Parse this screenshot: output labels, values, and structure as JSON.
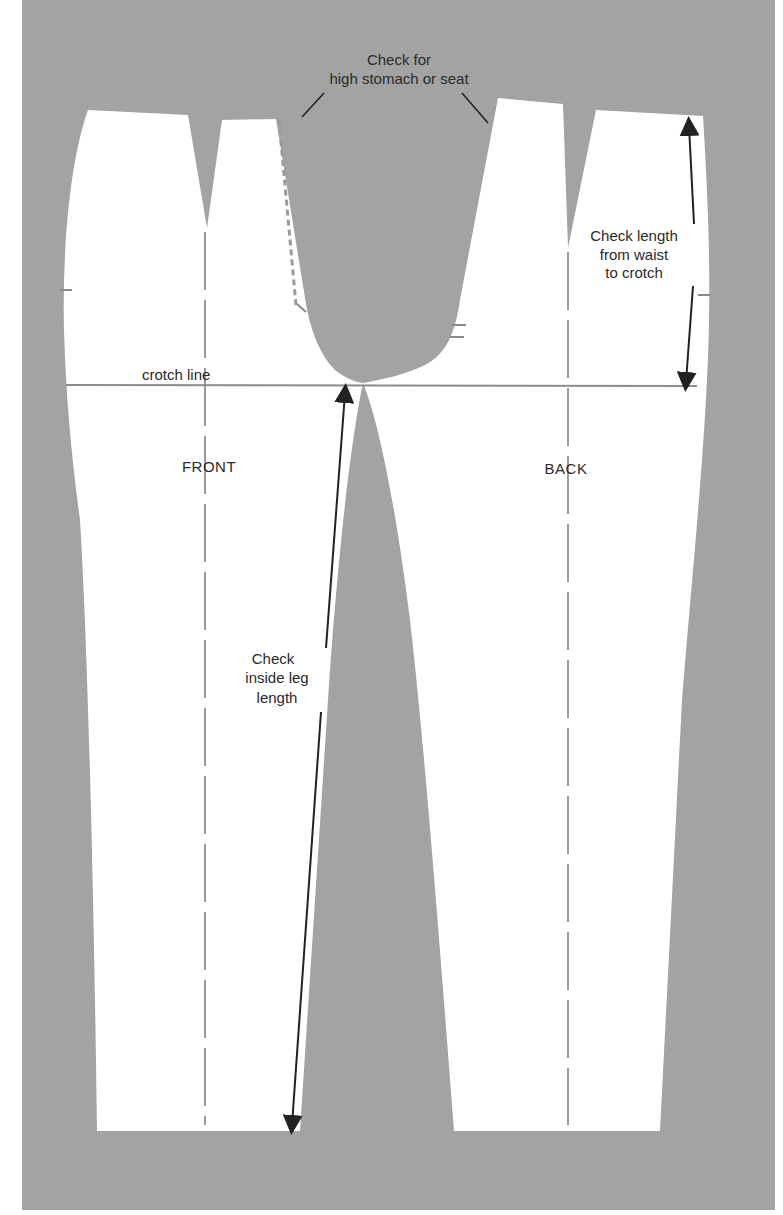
{
  "figure": {
    "background_color": "#a3a3a3",
    "page_color": "#ffffff",
    "pattern_color": "#ffffff",
    "line_color": "#222222",
    "guide_color": "#9a9a9a"
  },
  "labels": {
    "high_stomach_line1": "Check for",
    "high_stomach_line2": "high stomach or seat",
    "waist_crotch_line1": "Check length",
    "waist_crotch_line2": "from waist",
    "waist_crotch_line3": "to crotch",
    "crotch_line": "crotch line",
    "front": "FRONT",
    "back": "BACK",
    "inside_leg_line1": "Check",
    "inside_leg_line2": "inside leg",
    "inside_leg_line3": "length"
  },
  "pieces": [
    {
      "name": "front-trouser-piece",
      "label": "FRONT"
    },
    {
      "name": "back-trouser-piece",
      "label": "BACK"
    }
  ]
}
